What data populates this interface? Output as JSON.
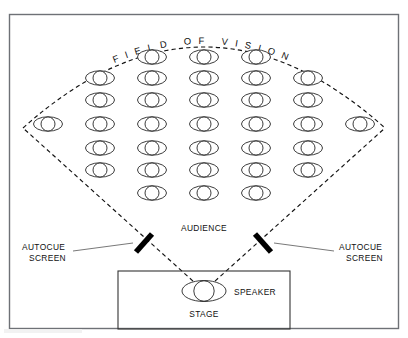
{
  "diagram": {
    "title_arc": "FIELD OF VISION",
    "labels": {
      "audience": "AUDIENCE",
      "autocue_left_line1": "AUTOCUE",
      "autocue_left_line2": "SCREEN",
      "autocue_right_line1": "AUTOCUE",
      "autocue_right_line2": "SCREEN",
      "speaker": "SPEAKER",
      "stage": "STAGE"
    },
    "colors": {
      "frame_border": "#6e7176",
      "ink": "#111111",
      "person_outline": "#1a1a1a",
      "autocue_bar": "#000000",
      "leader": "#555555",
      "background": "#ffffff"
    },
    "audience_layout": {
      "row_person_counts": [
        3,
        5,
        5,
        7,
        5,
        5,
        3
      ],
      "total_people": 33,
      "row_y": [
        57,
        78,
        100,
        124,
        148,
        170,
        193
      ],
      "person_body_rx": 14.5,
      "person_body_ry": 7.2,
      "person_head_r": 7.0,
      "column_spacing": 52
    },
    "field_of_vision": {
      "apex_x": 204,
      "apex_y": 291,
      "arc_left_x": 23,
      "arc_left_y": 128,
      "arc_right_x": 385,
      "arc_right_y": 128,
      "arc_top_y": 42,
      "style": "dashed"
    },
    "autocue_screens": [
      {
        "side": "left",
        "x1": 136,
        "y1": 252,
        "x2": 152,
        "y2": 234,
        "tilt": "forward-slash"
      },
      {
        "side": "right",
        "x1": 255,
        "y1": 234,
        "x2": 271,
        "y2": 252,
        "tilt": "back-slash"
      }
    ],
    "stage": {
      "x": 118,
      "y": 271,
      "width": 172,
      "height": 58,
      "speaker_x": 204,
      "speaker_y": 291
    }
  }
}
